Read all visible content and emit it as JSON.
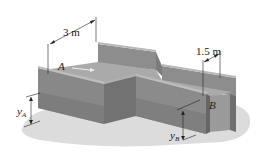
{
  "figure": {
    "labels": {
      "width_a": "3 m",
      "width_b": "1.5 m",
      "point_a": "A",
      "point_b": "B",
      "depth_a_main": "y",
      "depth_a_sub": "A",
      "depth_b_main": "y",
      "depth_b_sub": "B"
    },
    "colors": {
      "wall_front": "#8a8a8a",
      "wall_front_dark": "#7a7a7a",
      "wall_side": "#6f6f6f",
      "wall_top": "#b5b5b5",
      "water_surface": "#a9a9a9",
      "ground_shadow": "#d9d9d9",
      "dimension_line": "#222222"
    }
  }
}
